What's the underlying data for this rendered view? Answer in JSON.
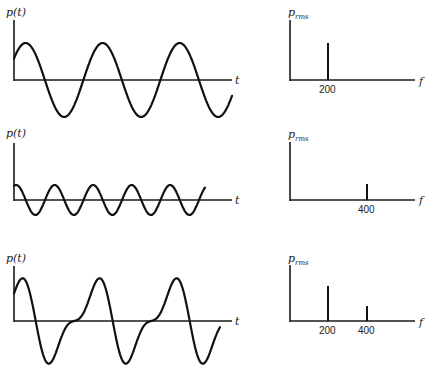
{
  "chart_data": [
    {
      "type": "line",
      "panel": "time-domain-1",
      "title": "",
      "ylabel": "p(t)",
      "xlabel": "t",
      "description": "Pure sinusoid, 200 Hz",
      "cycles_shown": 2.7,
      "amplitude": 1.0
    },
    {
      "type": "bar",
      "panel": "spectrum-1",
      "ylabel": "p_rms",
      "xlabel": "f",
      "categories": [
        "200"
      ],
      "x": [
        200
      ],
      "values": [
        0.62
      ]
    },
    {
      "type": "line",
      "panel": "time-domain-2",
      "ylabel": "p(t)",
      "xlabel": "t",
      "description": "Pure sinusoid, 400 Hz, lower amplitude",
      "cycles_shown": 5.3,
      "amplitude": 0.25
    },
    {
      "type": "bar",
      "panel": "spectrum-2",
      "ylabel": "p_rms",
      "xlabel": "f",
      "categories": [
        "400"
      ],
      "x": [
        400
      ],
      "values": [
        0.27
      ]
    },
    {
      "type": "line",
      "panel": "time-domain-3",
      "ylabel": "p(t)",
      "xlabel": "t",
      "description": "Sum of 200 Hz and 400 Hz components (distorted periodic wave)",
      "cycles_shown": 2.6,
      "amplitude": 1.0
    },
    {
      "type": "bar",
      "panel": "spectrum-3",
      "ylabel": "p_rms",
      "xlabel": "f",
      "categories": [
        "200",
        "400"
      ],
      "x": [
        200,
        400
      ],
      "values": [
        0.62,
        0.27
      ]
    }
  ],
  "labels": {
    "p_t": "p(t)",
    "t": "t",
    "p": "p",
    "rms": "rms",
    "f": "f",
    "tick_200": "200",
    "tick_400": "400"
  }
}
